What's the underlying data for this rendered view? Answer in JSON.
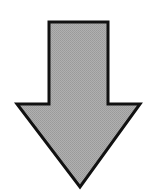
{
  "diagram": {
    "shape": "down-arrow",
    "direction": "down",
    "fill": "#a9a9a9",
    "stroke": "#111111",
    "stroke_width": 3,
    "points": "49,22 108,22 108,104 140,104 80,187 17,104 49,104"
  }
}
